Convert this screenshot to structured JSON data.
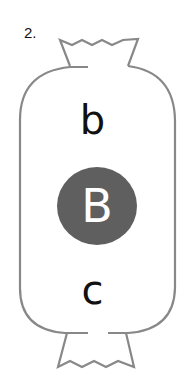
{
  "item_number": "2.",
  "candy": {
    "top_letter": "b",
    "center_letter": "B",
    "bottom_letter": "c",
    "outline_color": "#888888",
    "circle_color": "#5f5f5f",
    "center_letter_color": "#ffffff"
  }
}
